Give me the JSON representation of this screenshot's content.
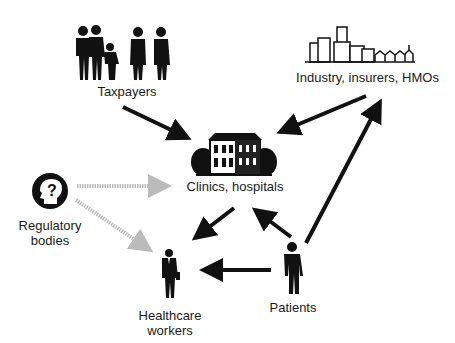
{
  "nodes": {
    "taxpayers": {
      "label": "Taxpayers",
      "icon": "family-silhouettes-icon"
    },
    "industry": {
      "label": "Industry, insurers, HMOs",
      "icon": "city-skyline-icon"
    },
    "clinics": {
      "label": "Clinics, hospitals",
      "icon": "hospital-building-icon"
    },
    "regulatory": {
      "label_line1": "Regulatory",
      "label_line2": "bodies",
      "icon": "head-question-icon"
    },
    "healthcare": {
      "label_line1": "Healthcare",
      "label_line2": "workers",
      "icon": "businessman-icon"
    },
    "patients": {
      "label": "Patients",
      "icon": "person-silhouette-icon"
    }
  },
  "edges": [
    {
      "from": "taxpayers",
      "to": "clinics",
      "style": "solid"
    },
    {
      "from": "industry",
      "to": "clinics",
      "style": "solid"
    },
    {
      "from": "regulatory",
      "to": "clinics",
      "style": "hatched"
    },
    {
      "from": "regulatory",
      "to": "healthcare",
      "style": "hatched"
    },
    {
      "from": "clinics",
      "to": "healthcare",
      "style": "solid"
    },
    {
      "from": "patients",
      "to": "clinics",
      "style": "solid"
    },
    {
      "from": "patients",
      "to": "healthcare",
      "style": "solid"
    },
    {
      "from": "patients",
      "to": "industry",
      "style": "solid"
    }
  ],
  "colors": {
    "ink": "#111111",
    "hatched": "#9a9a9a",
    "background": "#ffffff"
  }
}
